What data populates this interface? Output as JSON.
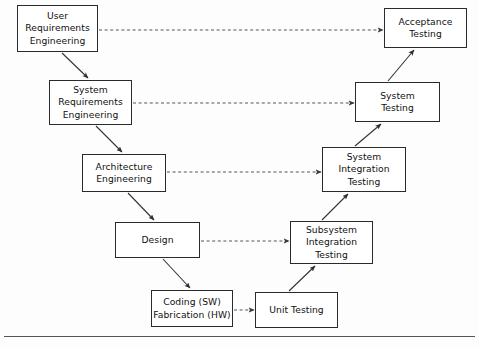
{
  "diagram": {
    "type": "v-model-flow",
    "background_color": "#fdfdfd",
    "box_border_color": "#2b2b2b",
    "solid_arrow_color": "#333333",
    "dashed_arrow_color": "#555555",
    "footer_rule_color": "#555555",
    "development_side": {
      "label": "Development / Specification (left descending branch)",
      "nodes": [
        {
          "id": "user-requirements-engineering",
          "lines": [
            "User",
            "Requirements",
            "Engineering"
          ],
          "x": 17,
          "y": 5,
          "w": 81,
          "h": 47
        },
        {
          "id": "system-requirements-engineering",
          "lines": [
            "System",
            "Requirements",
            "Engineering"
          ],
          "x": 49,
          "y": 80,
          "w": 83,
          "h": 45
        },
        {
          "id": "architecture-engineering",
          "lines": [
            "Architecture",
            "Engineering"
          ],
          "x": 82,
          "y": 154,
          "w": 84,
          "h": 38
        },
        {
          "id": "design",
          "lines": [
            "Design"
          ],
          "x": 115,
          "y": 222,
          "w": 85,
          "h": 36
        },
        {
          "id": "coding-fabrication",
          "lines": [
            "Coding (SW)",
            "Fabrication (HW)"
          ],
          "x": 151,
          "y": 290,
          "w": 82,
          "h": 37
        }
      ]
    },
    "testing_side": {
      "label": "Verification / Testing (right ascending branch)",
      "nodes": [
        {
          "id": "unit-testing",
          "lines": [
            "Unit Testing"
          ],
          "x": 255,
          "y": 292,
          "w": 83,
          "h": 36
        },
        {
          "id": "subsystem-integration-testing",
          "lines": [
            "Subsystem",
            "Integration",
            "Testing"
          ],
          "x": 290,
          "y": 221,
          "w": 83,
          "h": 43
        },
        {
          "id": "system-integration-testing",
          "lines": [
            "System",
            "Integration",
            "Testing"
          ],
          "x": 322,
          "y": 147,
          "w": 84,
          "h": 45
        },
        {
          "id": "system-testing",
          "lines": [
            "System",
            "Testing"
          ],
          "x": 355,
          "y": 82,
          "w": 85,
          "h": 40
        },
        {
          "id": "acceptance-testing",
          "lines": [
            "Acceptance",
            "Testing"
          ],
          "x": 384,
          "y": 8,
          "w": 83,
          "h": 40
        }
      ]
    },
    "solid_arrows": [
      {
        "id": "user-req-to-system-req",
        "from": "user-requirements-engineering",
        "to": "system-requirements-engineering",
        "x1": 62,
        "y1": 53,
        "x2": 88,
        "y2": 78
      },
      {
        "id": "system-req-to-architecture",
        "from": "system-requirements-engineering",
        "to": "architecture-engineering",
        "x1": 96,
        "y1": 126,
        "x2": 122,
        "y2": 152
      },
      {
        "id": "architecture-to-design",
        "from": "architecture-engineering",
        "to": "design",
        "x1": 128,
        "y1": 193,
        "x2": 154,
        "y2": 220
      },
      {
        "id": "design-to-coding",
        "from": "design",
        "to": "coding-fabrication",
        "x1": 163,
        "y1": 259,
        "x2": 190,
        "y2": 288
      },
      {
        "id": "unit-to-subsystem-integration",
        "from": "unit-testing",
        "to": "subsystem-integration-testing",
        "x1": 289,
        "y1": 291,
        "x2": 315,
        "y2": 266
      },
      {
        "id": "subsystem-to-system-integration",
        "from": "subsystem-integration-testing",
        "to": "system-integration-testing",
        "x1": 322,
        "y1": 220,
        "x2": 348,
        "y2": 194
      },
      {
        "id": "system-integration-to-system-testing",
        "from": "system-integration-testing",
        "to": "system-testing",
        "x1": 355,
        "y1": 146,
        "x2": 381,
        "y2": 124
      },
      {
        "id": "system-testing-to-acceptance",
        "from": "system-testing",
        "to": "acceptance-testing",
        "x1": 388,
        "y1": 81,
        "x2": 414,
        "y2": 50
      }
    ],
    "dashed_arrows": [
      {
        "id": "user-req-verifies-acceptance",
        "from": "user-requirements-engineering",
        "to": "acceptance-testing",
        "x1": 99,
        "y1": 30,
        "x2": 383,
        "y2": 30
      },
      {
        "id": "system-req-verifies-system-testing",
        "from": "system-requirements-engineering",
        "to": "system-testing",
        "x1": 133,
        "y1": 103,
        "x2": 354,
        "y2": 103
      },
      {
        "id": "architecture-verifies-system-integration",
        "from": "architecture-engineering",
        "to": "system-integration-testing",
        "x1": 167,
        "y1": 172,
        "x2": 321,
        "y2": 172
      },
      {
        "id": "design-verifies-subsystem-integration",
        "from": "design",
        "to": "subsystem-integration-testing",
        "x1": 201,
        "y1": 241,
        "x2": 289,
        "y2": 241
      },
      {
        "id": "coding-verifies-unit-testing",
        "from": "coding-fabrication",
        "to": "unit-testing",
        "x1": 234,
        "y1": 310,
        "x2": 254,
        "y2": 310
      }
    ],
    "footer_rule": {
      "x": 4,
      "y": 336,
      "width": 471
    }
  }
}
